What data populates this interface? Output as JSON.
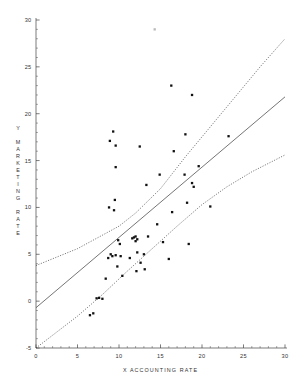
{
  "chart_data": {
    "type": "scatter",
    "title": "",
    "xlabel": "X ACCOUNTING RATE",
    "ylabel": "Y MARKETING RATE",
    "xlim": [
      0,
      30
    ],
    "ylim": [
      -5,
      30
    ],
    "xticks": [
      0,
      5,
      10,
      15,
      20,
      25,
      30
    ],
    "yticks": [
      -5,
      0,
      5,
      10,
      15,
      20,
      25,
      30
    ],
    "xtick_labels": [
      "0",
      "5",
      "10",
      "15",
      "20",
      "25",
      "30"
    ],
    "ytick_labels": [
      "-5",
      "0",
      "5",
      "10",
      "15",
      "20",
      "25",
      "30"
    ],
    "minor_tick_step": 1,
    "grid": false,
    "legend": null,
    "marker": "filled-square",
    "points": [
      {
        "x": 6.5,
        "y": -1.5
      },
      {
        "x": 6.9,
        "y": -1.3
      },
      {
        "x": 7.3,
        "y": 0.3
      },
      {
        "x": 7.6,
        "y": 0.35
      },
      {
        "x": 8.0,
        "y": 0.25
      },
      {
        "x": 8.4,
        "y": 2.4
      },
      {
        "x": 8.7,
        "y": 4.6
      },
      {
        "x": 9.0,
        "y": 5.0
      },
      {
        "x": 9.2,
        "y": 4.8
      },
      {
        "x": 9.6,
        "y": 4.9
      },
      {
        "x": 9.8,
        "y": 3.7
      },
      {
        "x": 10.2,
        "y": 4.8
      },
      {
        "x": 9.9,
        "y": 6.5
      },
      {
        "x": 10.1,
        "y": 6.1
      },
      {
        "x": 10.4,
        "y": 2.7
      },
      {
        "x": 11.3,
        "y": 4.6
      },
      {
        "x": 11.6,
        "y": 6.7
      },
      {
        "x": 11.8,
        "y": 6.8
      },
      {
        "x": 12.0,
        "y": 6.9
      },
      {
        "x": 12.0,
        "y": 6.4
      },
      {
        "x": 12.2,
        "y": 6.6
      },
      {
        "x": 12.2,
        "y": 5.2
      },
      {
        "x": 12.1,
        "y": 3.2
      },
      {
        "x": 12.6,
        "y": 4.1
      },
      {
        "x": 13.0,
        "y": 5.0
      },
      {
        "x": 13.1,
        "y": 3.4
      },
      {
        "x": 13.5,
        "y": 6.9
      },
      {
        "x": 13.3,
        "y": 12.4
      },
      {
        "x": 14.6,
        "y": 8.2
      },
      {
        "x": 14.9,
        "y": 13.5
      },
      {
        "x": 15.3,
        "y": 6.3
      },
      {
        "x": 16.0,
        "y": 4.5
      },
      {
        "x": 16.4,
        "y": 9.5
      },
      {
        "x": 16.6,
        "y": 16.0
      },
      {
        "x": 17.9,
        "y": 13.5
      },
      {
        "x": 18.0,
        "y": 17.8
      },
      {
        "x": 18.4,
        "y": 6.1
      },
      {
        "x": 18.2,
        "y": 10.5
      },
      {
        "x": 19.0,
        "y": 12.2
      },
      {
        "x": 18.8,
        "y": 12.6
      },
      {
        "x": 19.6,
        "y": 14.4
      },
      {
        "x": 21.0,
        "y": 10.1
      },
      {
        "x": 23.2,
        "y": 17.6
      },
      {
        "x": 9.3,
        "y": 18.1
      },
      {
        "x": 8.9,
        "y": 17.1
      },
      {
        "x": 9.6,
        "y": 16.6
      },
      {
        "x": 9.6,
        "y": 14.3
      },
      {
        "x": 12.5,
        "y": 16.5
      },
      {
        "x": 9.5,
        "y": 10.8
      },
      {
        "x": 8.8,
        "y": 10.0
      },
      {
        "x": 9.4,
        "y": 9.7
      },
      {
        "x": 16.3,
        "y": 23.0
      },
      {
        "x": 18.8,
        "y": 22.0
      },
      {
        "x": 14.3,
        "y": 29.0
      }
    ],
    "outlier_faint": {
      "x": 14.3,
      "y": 29.0
    },
    "fit_line": {
      "name": "regression line",
      "style": "solid",
      "x0": 0,
      "y0": -0.7,
      "x1": 30,
      "y1": 21.8
    },
    "confidence_bands": [
      {
        "name": "upper confidence band",
        "style": "dashed",
        "points": [
          {
            "x": 0,
            "y": 3.8
          },
          {
            "x": 5,
            "y": 5.6
          },
          {
            "x": 10,
            "y": 8.0
          },
          {
            "x": 12,
            "y": 9.4
          },
          {
            "x": 15,
            "y": 12.0
          },
          {
            "x": 18,
            "y": 15.4
          },
          {
            "x": 21,
            "y": 18.6
          },
          {
            "x": 24,
            "y": 21.8
          },
          {
            "x": 27,
            "y": 25.0
          },
          {
            "x": 30,
            "y": 28.0
          }
        ]
      },
      {
        "name": "lower confidence band",
        "style": "dashed",
        "points": [
          {
            "x": 0,
            "y": -5.0
          },
          {
            "x": 5,
            "y": -1.6
          },
          {
            "x": 8,
            "y": 0.7
          },
          {
            "x": 11,
            "y": 3.2
          },
          {
            "x": 14,
            "y": 5.6
          },
          {
            "x": 17,
            "y": 8.0
          },
          {
            "x": 20,
            "y": 10.3
          },
          {
            "x": 23,
            "y": 12.2
          },
          {
            "x": 26,
            "y": 13.8
          },
          {
            "x": 30,
            "y": 15.6
          }
        ]
      }
    ]
  }
}
